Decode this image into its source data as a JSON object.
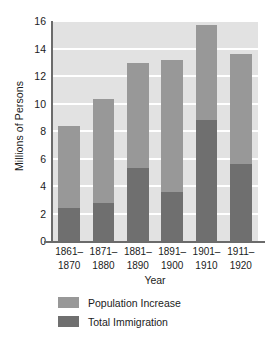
{
  "chart_data": {
    "type": "bar",
    "subtype": "stacked-bar",
    "title": "",
    "xlabel": "Year",
    "ylabel": "Millions of Persons",
    "categories": [
      "1861–1870",
      "1871–1880",
      "1881–1890",
      "1891–1900",
      "1901–1910",
      "1911–1920"
    ],
    "category_lines": [
      [
        "1861–",
        "1870"
      ],
      [
        "1871–",
        "1880"
      ],
      [
        "1881–",
        "1890"
      ],
      [
        "1891–",
        "1900"
      ],
      [
        "1901–",
        "1910"
      ],
      [
        "1911–",
        "1920"
      ]
    ],
    "series": [
      {
        "name": "Total Immigration",
        "color": "#6f6f6f",
        "values": [
          2.4,
          2.8,
          5.3,
          3.6,
          8.8,
          5.6
        ]
      },
      {
        "name": "Population Increase",
        "color": "#989898",
        "values": [
          6.0,
          7.5,
          7.65,
          9.6,
          6.9,
          8.0
        ]
      }
    ],
    "totals": [
      8.4,
      10.3,
      12.95,
      13.2,
      15.7,
      13.6
    ],
    "ylim": [
      0,
      16
    ],
    "yticks": [
      0,
      2,
      4,
      6,
      8,
      10,
      12,
      14,
      16
    ],
    "ytick_labels": [
      "0",
      "2",
      "4",
      "6",
      "8",
      "10",
      "12",
      "14",
      "16"
    ],
    "grid": true,
    "grid_color": "#ffffff",
    "plot_background": "#e2e2e2",
    "legend_position": "bottom-left",
    "stack_order_bottom_to_top": [
      "Total Immigration",
      "Population Increase"
    ]
  },
  "legend": {
    "items": [
      {
        "label": "Population Increase",
        "color": "#989898"
      },
      {
        "label": "Total Immigration",
        "color": "#6f6f6f"
      }
    ]
  }
}
